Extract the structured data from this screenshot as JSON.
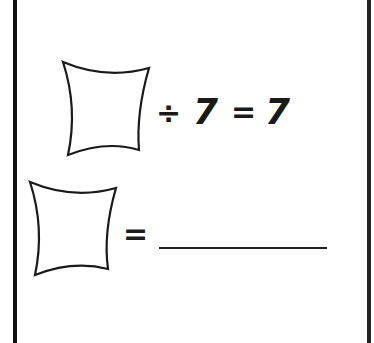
{
  "worksheet": {
    "equation1": {
      "blank": "",
      "operator": "÷",
      "divisor": "7",
      "equals": "=",
      "result": "7"
    },
    "equation2": {
      "blank": "",
      "equals": "=",
      "answer": ""
    }
  }
}
